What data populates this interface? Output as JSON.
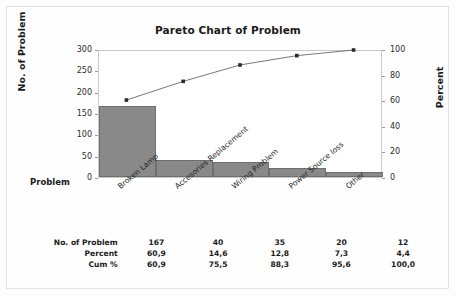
{
  "chart_data": {
    "type": "bar",
    "title": "Pareto Chart of Problem",
    "xlabel": "Problem",
    "ylabel": "No. of Problem",
    "y2label": "Percent",
    "categories": [
      "Broken Lamp",
      "Accesories Replacement",
      "Wiring Problem",
      "Power Source loss",
      "Other"
    ],
    "values": [
      167,
      40,
      35,
      20,
      12
    ],
    "percent": [
      "60,9",
      "14,6",
      "12,8",
      "7,3",
      "4,4"
    ],
    "cum_percent": [
      "60,9",
      "75,5",
      "88,3",
      "95,6",
      "100,0"
    ],
    "cum_values": [
      60.9,
      75.5,
      88.3,
      95.6,
      100.0
    ],
    "ylim": [
      0,
      300
    ],
    "y2lim": [
      0,
      100
    ],
    "yticks": [
      "0",
      "50",
      "100",
      "150",
      "200",
      "250",
      "300"
    ],
    "ytick_values": [
      0,
      50,
      100,
      150,
      200,
      250,
      300
    ],
    "y2ticks": [
      "0",
      "20",
      "40",
      "60",
      "80",
      "100"
    ],
    "y2tick_values": [
      0,
      20,
      40,
      60,
      80,
      100
    ],
    "grid": false,
    "legend": "none",
    "series": [
      {
        "name": "No. of Problem",
        "type": "bar",
        "values": [
          167,
          40,
          35,
          20,
          12
        ],
        "color": "#898989"
      },
      {
        "name": "Cum %",
        "type": "line",
        "values": [
          60.9,
          75.5,
          88.3,
          95.6,
          100.0
        ],
        "color": "#555555"
      }
    ]
  },
  "table": {
    "rows": [
      {
        "label": "No. of Problem",
        "cells": [
          "167",
          "40",
          "35",
          "20",
          "12"
        ]
      },
      {
        "label": "Percent",
        "cells": [
          "60,9",
          "14,6",
          "12,8",
          "7,3",
          "4,4"
        ]
      },
      {
        "label": "Cum %",
        "cells": [
          "60,9",
          "75,5",
          "88,3",
          "95,6",
          "100,0"
        ]
      }
    ]
  },
  "colors": {
    "bar_fill": "#898989",
    "bar_border": "#6f6f6f",
    "line": "#555555",
    "marker": "#2a2a2a",
    "axis": "#c9c9c9",
    "text": "#1a1a1a",
    "page_border": "#e3e3e3"
  }
}
